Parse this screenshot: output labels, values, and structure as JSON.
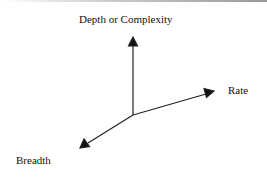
{
  "diagram": {
    "axes": [
      {
        "name": "depth",
        "label": "Depth or Complexity",
        "direction": "up"
      },
      {
        "name": "rate",
        "label": "Rate",
        "direction": "right-up"
      },
      {
        "name": "breadth",
        "label": "Breadth",
        "direction": "left-down"
      }
    ],
    "colors": {
      "line": "#222222",
      "background": "#ffffff"
    }
  }
}
